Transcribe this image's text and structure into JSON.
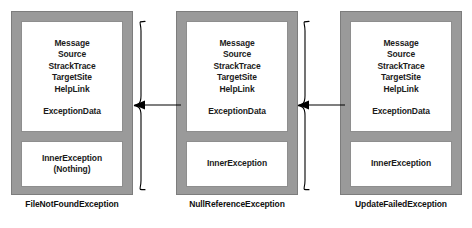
{
  "diagram": {
    "colors": {
      "frame": "#9a9a9a",
      "panel": "#ffffff",
      "text": "#1b1b1b",
      "connector": "#000000"
    },
    "boxes": [
      {
        "id": "file-not-found-exception",
        "caption": "FileNotFoundException",
        "properties": [
          "Message",
          "Source",
          "StrackTrace",
          "TargetSite",
          "HelpLink"
        ],
        "data_property": "ExceptionData",
        "inner_exception_label": "InnerException",
        "inner_exception_value": "(Nothing)"
      },
      {
        "id": "null-reference-exception",
        "caption": "NullReferenceException",
        "properties": [
          "Message",
          "Source",
          "StrackTrace",
          "TargetSite",
          "HelpLink"
        ],
        "data_property": "ExceptionData",
        "inner_exception_label": "InnerException",
        "inner_exception_value": ""
      },
      {
        "id": "update-failed-exception",
        "caption": "UpdateFailedException",
        "properties": [
          "Message",
          "Source",
          "StrackTrace",
          "TargetSite",
          "HelpLink"
        ],
        "data_property": "ExceptionData",
        "inner_exception_label": "InnerException",
        "inner_exception_value": ""
      }
    ],
    "connectors": [
      {
        "id": "connector-null-to-file",
        "from": "null-reference-exception",
        "to": "file-not-found-exception",
        "direction": "left",
        "style": "brace-arrow"
      },
      {
        "id": "connector-update-to-null",
        "from": "update-failed-exception",
        "to": "null-reference-exception",
        "direction": "left",
        "style": "brace-arrow"
      }
    ]
  }
}
